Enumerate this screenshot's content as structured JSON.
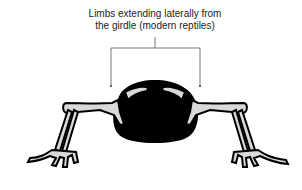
{
  "diagram": {
    "caption_line1": "Limbs extending laterally from",
    "caption_line2": "the girdle (modern reptiles)",
    "colors": {
      "body": "#000000",
      "bone": "#d9d9d9",
      "outline": "#111111",
      "text": "#222222",
      "background": "#ffffff"
    }
  }
}
